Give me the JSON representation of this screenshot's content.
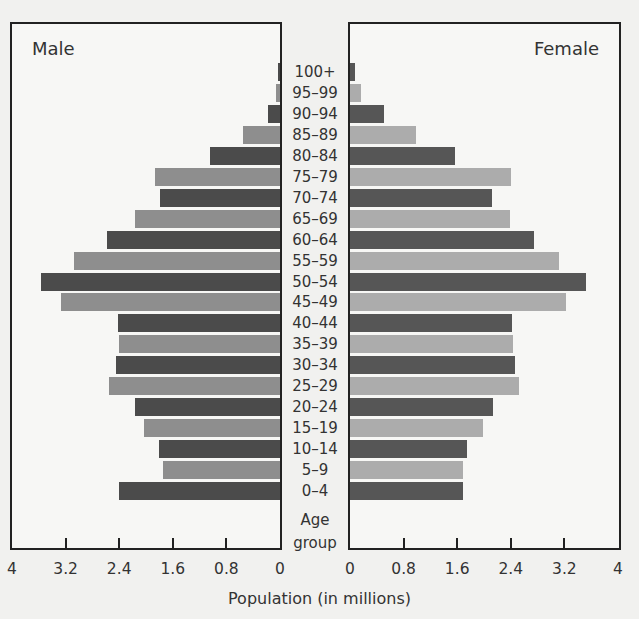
{
  "chart_data": {
    "type": "bar",
    "subtype": "population-pyramid",
    "title": "",
    "xlabel": "Population (in millions)",
    "ylabel": "Age group",
    "categories": [
      "100+",
      "95–99",
      "90–94",
      "85–89",
      "80–84",
      "75–79",
      "70–74",
      "65–69",
      "60–64",
      "55–59",
      "50–54",
      "45–49",
      "40–44",
      "35–39",
      "30–34",
      "25–29",
      "20–24",
      "15–19",
      "10–14",
      "5–9",
      "0–4"
    ],
    "series": [
      {
        "name": "Male",
        "values": [
          0.03,
          0.06,
          0.18,
          0.55,
          1.05,
          1.87,
          1.8,
          2.17,
          2.59,
          3.09,
          3.58,
          3.28,
          2.43,
          2.41,
          2.46,
          2.56,
          2.17,
          2.04,
          1.81,
          1.75,
          2.41
        ]
      },
      {
        "name": "Female",
        "values": [
          0.07,
          0.16,
          0.51,
          0.99,
          1.57,
          2.4,
          2.12,
          2.39,
          2.75,
          3.12,
          3.52,
          3.22,
          2.42,
          2.43,
          2.46,
          2.52,
          2.13,
          1.99,
          1.75,
          1.69,
          1.69
        ]
      }
    ],
    "xlim": [
      0,
      4
    ],
    "x_ticks_male": [
      "4",
      "3.2",
      "2.4",
      "1.6",
      "0.8",
      "0"
    ],
    "x_ticks_female": [
      "0",
      "0.8",
      "1.6",
      "2.4",
      "3.2",
      "4"
    ],
    "grid": false,
    "legend": "panel titles (Male left, Female right)",
    "colors": {
      "dark": "#4b4b4b",
      "light": "#8e8e8e",
      "female_light": "#acacac"
    }
  },
  "labels": {
    "male": "Male",
    "female": "Female",
    "age_group_line1": "Age",
    "age_group_line2": "group",
    "xlabel": "Population (in millions)"
  }
}
